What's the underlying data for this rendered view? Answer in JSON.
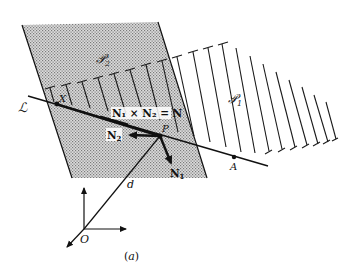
{
  "figure": {
    "caption": "(a)",
    "colors": {
      "ink": "#111111",
      "stipple": "#8a8a8a",
      "stipple_bg": "#d6d6d6",
      "background": "#ffffff"
    },
    "labels": {
      "plane_1": "𝒫",
      "plane_1_sub": "1",
      "plane_2": "𝒫",
      "plane_2_sub": "2",
      "line": "ℒ",
      "point_x": "X",
      "point_p": "P",
      "point_a": "A",
      "origin": "O",
      "distance": "d",
      "normal_1": "N",
      "normal_1_sub": "1",
      "normal_2": "N",
      "normal_2_sub": "2",
      "cross_product": "N₁ × N₂ = N"
    }
  }
}
